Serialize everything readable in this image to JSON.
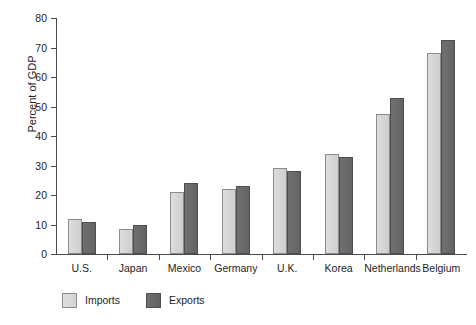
{
  "chart_data": {
    "type": "bar",
    "title": "",
    "xlabel": "",
    "ylabel": "Percent of GDP",
    "ylim": [
      0,
      80
    ],
    "yticks": [
      0,
      10,
      20,
      30,
      40,
      50,
      60,
      70,
      80
    ],
    "ytick_labels": [
      "0",
      "10",
      "20",
      "30",
      "40",
      "50",
      "60",
      "70",
      "80"
    ],
    "grid": false,
    "legend_position": "bottom-left",
    "categories": [
      "U.S.",
      "Japan",
      "Mexico",
      "Germany",
      "U.K.",
      "Korea",
      "Netherlands",
      "Belgium"
    ],
    "series": [
      {
        "name": "Imports",
        "color": "#d6d6d6",
        "values": [
          12,
          8.5,
          21,
          22,
          29,
          34,
          47.5,
          68
        ]
      },
      {
        "name": "Exports",
        "color": "#6b6b6b",
        "values": [
          11,
          10,
          24,
          23,
          28,
          33,
          53,
          72.5
        ]
      }
    ]
  },
  "legend": {
    "items": [
      {
        "label": "Imports",
        "swatch": "light-gray-square"
      },
      {
        "label": "Exports",
        "swatch": "dark-gray-square"
      }
    ]
  },
  "axes": {
    "y_title": "Percent of GDP"
  }
}
